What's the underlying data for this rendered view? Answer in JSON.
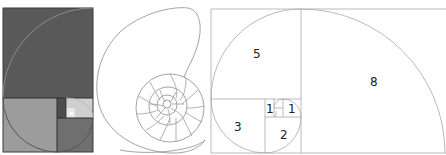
{
  "figure": {
    "panels": [
      {
        "name": "shaded-golden-rectangle",
        "description": "Golden rectangle subdivided into shaded Fibonacci squares with spiral"
      },
      {
        "name": "nautilus-shell",
        "description": "Line drawing of nautilus shell with chambered spiral"
      },
      {
        "name": "fibonacci-spiral-labeled",
        "description": "Fibonacci squares with labeled sizes and spiral arc"
      }
    ],
    "labels": {
      "sq8": "8",
      "sq5": "5",
      "sq3": "3",
      "sq2": "2",
      "sq1a": "1",
      "sq1b": "1"
    },
    "colors": {
      "dark": "#5a5a5a",
      "mid_dark": "#6e6e6e",
      "mid": "#9a9a9a",
      "light": "#c8c8c8",
      "lighter": "#dedede",
      "line": "#9e9e9e"
    }
  }
}
